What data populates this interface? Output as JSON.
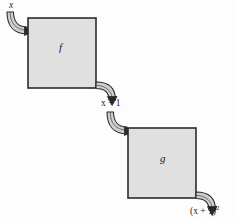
{
  "diagram": {
    "type": "function-composition-block-diagram",
    "background_color": "#fdfdfd",
    "box_fill_color": "#e0e0e0",
    "box_stroke_color": "#2b2b2b",
    "arrow_fill_color": "#cfcfcf",
    "arrow_stroke_color": "#2b2b2b",
    "text_color": "#1a1a1a",
    "boxes": [
      {
        "id": "box-f",
        "label": "f",
        "x": 28,
        "y": 18,
        "width": 68,
        "height": 70
      },
      {
        "id": "box-g",
        "label": "g",
        "x": 128,
        "y": 128,
        "width": 68,
        "height": 70
      }
    ],
    "labels": {
      "input": "x",
      "intermediate": "x + 1",
      "output_base": "(x + 1)",
      "output_exponent": "2"
    },
    "arrows": [
      {
        "id": "arrow-in-f",
        "from": "input-x",
        "to": "box-f",
        "direction": "into-top-left"
      },
      {
        "id": "arrow-out-f",
        "from": "box-f",
        "to": "intermediate",
        "direction": "out-bottom-right"
      },
      {
        "id": "arrow-in-g",
        "from": "intermediate",
        "to": "box-g",
        "direction": "into-top-left"
      },
      {
        "id": "arrow-out-g",
        "from": "box-g",
        "to": "output",
        "direction": "out-bottom-right"
      }
    ]
  }
}
